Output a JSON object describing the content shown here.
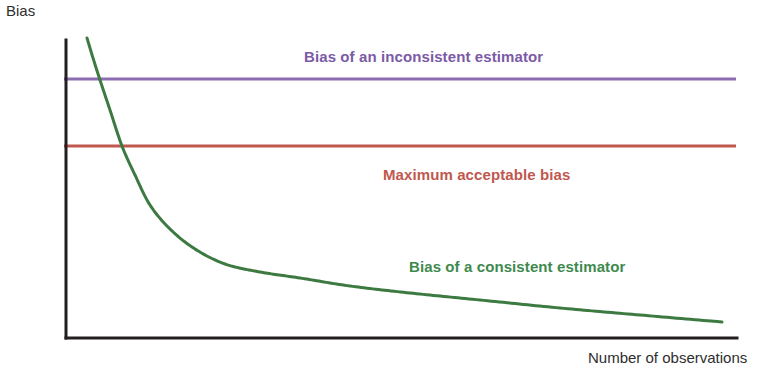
{
  "figure": {
    "background_color": "#ffffff",
    "width": 780,
    "height": 371
  },
  "axes": {
    "y_title": "Bias",
    "x_title": "Number of observations",
    "axis_color": "#231f20",
    "axis_width": 3,
    "origin_x": 66,
    "origin_y": 338,
    "top_y": 40,
    "right_x": 737
  },
  "labels": {
    "inconsistent": {
      "text": "Bias of an inconsistent estimator",
      "color": "#7B5AA6"
    },
    "threshold": {
      "text": "Maximum acceptable bias",
      "color": "#C0584E"
    },
    "consistent": {
      "text": "Bias of a consistent estimator",
      "color": "#3E8A4E"
    }
  },
  "chart_data": {
    "type": "line",
    "title": "",
    "subtitle": "",
    "xlabel": "Number of observations",
    "ylabel": "Bias",
    "xlim": [
      0,
      100
    ],
    "ylim": [
      0,
      100
    ],
    "grid": false,
    "axis_ticks": false,
    "tick_labels": [],
    "legend": "inline-annotations",
    "legend_position": "inline",
    "annotations": [
      {
        "text": "Bias of an inconsistent estimator",
        "color": "#7B5AA6",
        "x": 0.355,
        "y": 0.845
      },
      {
        "text": "Maximum acceptable bias",
        "color": "#C0584E",
        "x": 0.473,
        "y": 0.46
      },
      {
        "text": "Bias of a consistent estimator",
        "color": "#3E8A4E",
        "x": 0.512,
        "y": 0.155
      }
    ],
    "series": [
      {
        "name": "Bias of an inconsistent estimator",
        "type": "horizontal-line",
        "color": "#8B6CB0",
        "width": 3,
        "y_value": 87,
        "x_start": 64,
        "x_end": 736,
        "pixel_y": 79,
        "values": [
          87,
          87
        ]
      },
      {
        "name": "Maximum acceptable bias",
        "type": "horizontal-line",
        "color": "#C0584E",
        "width": 3,
        "y_value": 64,
        "x_start": 64,
        "x_end": 736,
        "pixel_y": 146,
        "values": [
          64,
          64
        ]
      },
      {
        "name": "Bias of a consistent estimator",
        "type": "decay-curve",
        "color": "#3D7A41",
        "width": 3,
        "x": [
          87,
          93,
          100,
          110,
          122,
          135,
          150,
          170,
          195,
          225,
          260,
          300,
          350,
          410,
          480,
          560,
          640,
          722
        ],
        "y": [
          38,
          58,
          80,
          110,
          146,
          175,
          205,
          229,
          249,
          264,
          272,
          278,
          286,
          293,
          300,
          308,
          315,
          322
        ],
        "description": "Monotonically decreasing hyperbolic bias curve approaching zero"
      }
    ],
    "crossings": [
      {
        "label": "consistent crosses inconsistent level",
        "pixel_x": 97,
        "pixel_y": 79
      },
      {
        "label": "consistent crosses maximum acceptable bias",
        "pixel_x": 120,
        "pixel_y": 146
      }
    ]
  }
}
